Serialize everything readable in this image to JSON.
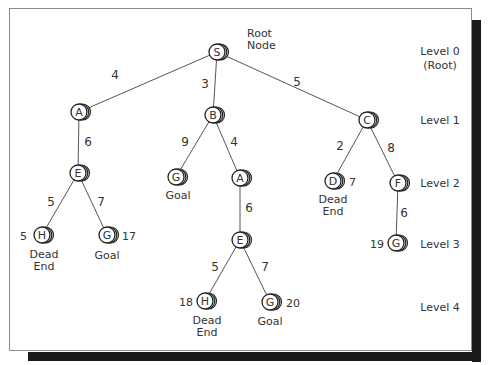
{
  "diagram": {
    "type": "search-tree",
    "nodes": [
      {
        "id": "S",
        "label": "S",
        "x": 217,
        "y": 52,
        "level": 0
      },
      {
        "id": "A1",
        "label": "A",
        "x": 79,
        "y": 112,
        "level": 1
      },
      {
        "id": "B",
        "label": "B",
        "x": 213,
        "y": 115,
        "level": 1
      },
      {
        "id": "C",
        "label": "C",
        "x": 367,
        "y": 120,
        "level": 1
      },
      {
        "id": "E1",
        "label": "E",
        "x": 78,
        "y": 173,
        "level": 2
      },
      {
        "id": "G1",
        "label": "G",
        "x": 176,
        "y": 177,
        "level": 2
      },
      {
        "id": "A2",
        "label": "A",
        "x": 240,
        "y": 178,
        "level": 2
      },
      {
        "id": "D",
        "label": "D",
        "x": 333,
        "y": 181,
        "level": 2
      },
      {
        "id": "F",
        "label": "F",
        "x": 398,
        "y": 183,
        "level": 2
      },
      {
        "id": "H1",
        "label": "H",
        "x": 42,
        "y": 235,
        "level": 3
      },
      {
        "id": "G2",
        "label": "G",
        "x": 107,
        "y": 235,
        "level": 3
      },
      {
        "id": "E2",
        "label": "E",
        "x": 240,
        "y": 240,
        "level": 3
      },
      {
        "id": "G3",
        "label": "G",
        "x": 396,
        "y": 243,
        "level": 3
      },
      {
        "id": "H2",
        "label": "H",
        "x": 205,
        "y": 301,
        "level": 4
      },
      {
        "id": "G4",
        "label": "G",
        "x": 270,
        "y": 302,
        "level": 4
      }
    ],
    "edges": [
      {
        "from": "S",
        "to": "A1",
        "cost": "4",
        "lx": 115,
        "ly": 79
      },
      {
        "from": "S",
        "to": "B",
        "cost": "3",
        "lx": 205,
        "ly": 88
      },
      {
        "from": "S",
        "to": "C",
        "cost": "5",
        "lx": 297,
        "ly": 86
      },
      {
        "from": "A1",
        "to": "E1",
        "cost": "6",
        "lx": 88,
        "ly": 146
      },
      {
        "from": "B",
        "to": "G1",
        "cost": "9",
        "lx": 185,
        "ly": 146
      },
      {
        "from": "B",
        "to": "A2",
        "cost": "4",
        "lx": 234,
        "ly": 146
      },
      {
        "from": "C",
        "to": "D",
        "cost": "2",
        "lx": 340,
        "ly": 150
      },
      {
        "from": "C",
        "to": "F",
        "cost": "8",
        "lx": 391,
        "ly": 152
      },
      {
        "from": "E1",
        "to": "H1",
        "cost": "5",
        "lx": 51,
        "ly": 206
      },
      {
        "from": "E1",
        "to": "G2",
        "cost": "7",
        "lx": 101,
        "ly": 206
      },
      {
        "from": "A2",
        "to": "E2",
        "cost": "6",
        "lx": 249,
        "ly": 212
      },
      {
        "from": "F",
        "to": "G3",
        "cost": "6",
        "lx": 404,
        "ly": 217
      },
      {
        "from": "E2",
        "to": "H2",
        "cost": "5",
        "lx": 215,
        "ly": 271
      },
      {
        "from": "E2",
        "to": "G4",
        "cost": "7",
        "lx": 265,
        "ly": 271
      }
    ],
    "annotations": [
      {
        "text": "Root",
        "x": 247,
        "y": 37,
        "anchor": "start"
      },
      {
        "text": "Node",
        "x": 247,
        "y": 49,
        "anchor": "start"
      },
      {
        "text": "Dead",
        "x": 44,
        "y": 258,
        "anchor": "middle"
      },
      {
        "text": "End",
        "x": 44,
        "y": 270,
        "anchor": "middle"
      },
      {
        "text": "17",
        "x": 122,
        "y": 240,
        "anchor": "start"
      },
      {
        "text": "Goal",
        "x": 107,
        "y": 259,
        "anchor": "middle"
      },
      {
        "text": "5",
        "x": 27,
        "y": 240,
        "anchor": "end"
      },
      {
        "text": "Goal",
        "x": 178,
        "y": 199,
        "anchor": "middle"
      },
      {
        "text": "7",
        "x": 349,
        "y": 186,
        "anchor": "start"
      },
      {
        "text": "Dead",
        "x": 333,
        "y": 203,
        "anchor": "middle"
      },
      {
        "text": "End",
        "x": 333,
        "y": 215,
        "anchor": "middle"
      },
      {
        "text": "19",
        "x": 384,
        "y": 248,
        "anchor": "end"
      },
      {
        "text": "18",
        "x": 193,
        "y": 306,
        "anchor": "end"
      },
      {
        "text": "Dead",
        "x": 207,
        "y": 324,
        "anchor": "middle"
      },
      {
        "text": "End",
        "x": 207,
        "y": 336,
        "anchor": "middle"
      },
      {
        "text": "20",
        "x": 286,
        "y": 307,
        "anchor": "start"
      },
      {
        "text": "Goal",
        "x": 270,
        "y": 325,
        "anchor": "middle"
      }
    ],
    "levels": [
      {
        "lines": [
          "Level 0",
          "(Root)"
        ],
        "x": 440,
        "y": 55
      },
      {
        "lines": [
          "Level 1"
        ],
        "x": 440,
        "y": 124
      },
      {
        "lines": [
          "Level 2"
        ],
        "x": 440,
        "y": 187
      },
      {
        "lines": [
          "Level 3"
        ],
        "x": 440,
        "y": 248
      },
      {
        "lines": [
          "Level 4"
        ],
        "x": 440,
        "y": 311
      }
    ]
  },
  "colors": {
    "stroke": "#222222",
    "edge": "#555555",
    "text": "#333333",
    "frame": "#8a8a8a",
    "shadow": "#1a1a1a"
  }
}
